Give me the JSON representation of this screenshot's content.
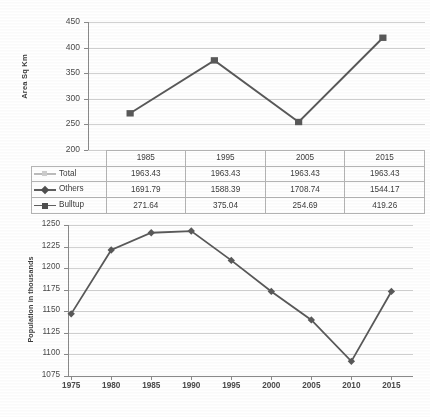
{
  "figure": {
    "background_color": "#ffffff",
    "line_color": "#595959",
    "marker_color": "#595959",
    "grid_color": "#c9c9c9",
    "axis_color": "#8a8a8a",
    "total_series_color": "#bdbdbd"
  },
  "top_chart": {
    "ylabel": "Area Sq Km",
    "yticks": [
      "450",
      "400",
      "350",
      "300",
      "250",
      "200"
    ],
    "table": {
      "corner_label": "",
      "columns": [
        "1985",
        "1995",
        "2005",
        "2015"
      ],
      "rows": [
        {
          "label": "Total",
          "marker": "tiny-square-marker",
          "color": "#bdbdbd",
          "values": [
            "1963.43",
            "1963.43",
            "1963.43",
            "1963.43"
          ]
        },
        {
          "label": "Others",
          "marker": "diamond-marker",
          "color": "#595959",
          "values": [
            "1691.79",
            "1588.39",
            "1708.74",
            "1544.17"
          ]
        },
        {
          "label": "Bulltup",
          "marker": "square-marker",
          "color": "#595959",
          "values": [
            "271.64",
            "375.04",
            "254.69",
            "419.26"
          ]
        }
      ]
    }
  },
  "bottom_chart": {
    "ylabel": "Population in thousands",
    "yticks": [
      "1250",
      "1225",
      "1200",
      "1175",
      "1150",
      "1125",
      "1100",
      "1075"
    ],
    "xticks": [
      "1975",
      "1980",
      "1985",
      "1990",
      "1995",
      "2000",
      "2005",
      "2010",
      "2015"
    ]
  },
  "chart_data": [
    {
      "type": "line",
      "title": "",
      "xlabel": "",
      "ylabel": "Area Sq Km",
      "categories": [
        "1985",
        "1995",
        "2005",
        "2015"
      ],
      "ylim": [
        200,
        450
      ],
      "yticks": [
        200,
        250,
        300,
        350,
        400,
        450
      ],
      "grid": true,
      "legend": "data-table",
      "series": [
        {
          "name": "Total",
          "values": [
            1963.43,
            1963.43,
            1963.43,
            1963.43
          ],
          "color": "#bdbdbd",
          "marker": "tiny-square",
          "visible_in_plot": false
        },
        {
          "name": "Others",
          "values": [
            1691.79,
            1588.39,
            1708.74,
            1544.17
          ],
          "color": "#595959",
          "marker": "diamond",
          "visible_in_plot": false
        },
        {
          "name": "Bulltup",
          "values": [
            271.64,
            375.04,
            254.69,
            419.26
          ],
          "color": "#595959",
          "marker": "square",
          "visible_in_plot": true
        }
      ]
    },
    {
      "type": "line",
      "title": "",
      "xlabel": "",
      "ylabel": "Population in thousands",
      "x": [
        1975,
        1980,
        1985,
        1990,
        1995,
        2000,
        2005,
        2010,
        2015
      ],
      "values": [
        1147,
        1221,
        1241,
        1243,
        1209,
        1173,
        1140,
        1092,
        1173
      ],
      "ylim": [
        1075,
        1250
      ],
      "yticks": [
        1075,
        1100,
        1125,
        1150,
        1175,
        1200,
        1225,
        1250
      ],
      "grid": true,
      "legend": "none",
      "color": "#595959",
      "marker": "diamond"
    }
  ]
}
